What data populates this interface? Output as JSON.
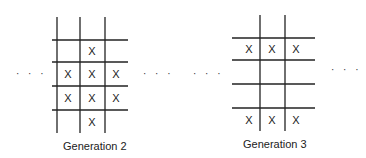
{
  "diagram": {
    "panels": [
      {
        "label": "Generation 2",
        "grid": {
          "vertical_lines_x": [
            57,
            80,
            105
          ],
          "vertical_span_y": [
            17,
            133
          ],
          "horizontal_lines_y": [
            40,
            62,
            86,
            110
          ],
          "horizontal_span_x": [
            52,
            128
          ]
        },
        "marks": [
          {
            "text": "X",
            "x": 92,
            "y": 51
          },
          {
            "text": "X",
            "x": 68,
            "y": 74
          },
          {
            "text": "X",
            "x": 92,
            "y": 74
          },
          {
            "text": "X",
            "x": 116,
            "y": 74
          },
          {
            "text": "X",
            "x": 68,
            "y": 98
          },
          {
            "text": "X",
            "x": 92,
            "y": 98
          },
          {
            "text": "X",
            "x": 116,
            "y": 98
          },
          {
            "text": "X",
            "x": 92,
            "y": 122
          }
        ]
      },
      {
        "label": "Generation 3",
        "grid": {
          "vertical_lines_x": [
            260,
            285
          ],
          "vertical_span_y": [
            15,
            131
          ],
          "horizontal_lines_y": [
            38,
            60,
            84,
            108
          ],
          "horizontal_span_x": [
            232,
            315
          ]
        },
        "marks": [
          {
            "text": "X",
            "x": 249,
            "y": 49
          },
          {
            "text": "X",
            "x": 272,
            "y": 49
          },
          {
            "text": "X",
            "x": 296,
            "y": 49
          },
          {
            "text": "X",
            "x": 249,
            "y": 120
          },
          {
            "text": "X",
            "x": 272,
            "y": 120
          },
          {
            "text": "X",
            "x": 296,
            "y": 120
          }
        ]
      }
    ],
    "ellipses": [
      {
        "text": "· · ·",
        "x": 16,
        "y": 69
      },
      {
        "text": "· · ·",
        "x": 143,
        "y": 69
      },
      {
        "text": "· · ·",
        "x": 193,
        "y": 69
      },
      {
        "text": "· · ·",
        "x": 331,
        "y": 65
      }
    ],
    "labels": {
      "gen2": "Generation 2",
      "gen3": "Generation 3"
    }
  }
}
